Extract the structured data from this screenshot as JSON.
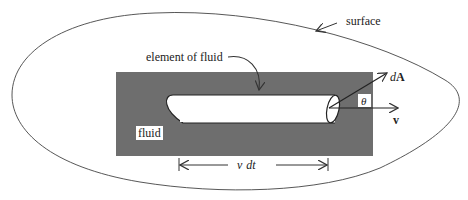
{
  "diagram": {
    "labels": {
      "surface": "surface",
      "element": "element of fluid",
      "fluid": "fluid",
      "dA_d": "d",
      "dA_A": "A",
      "theta": "θ",
      "v": "v",
      "vdt_v": "v",
      "vdt_dt": "dt"
    },
    "colors": {
      "fluid_fill": "#6e6e6e",
      "outline": "#333333",
      "background": "#ffffff"
    }
  }
}
